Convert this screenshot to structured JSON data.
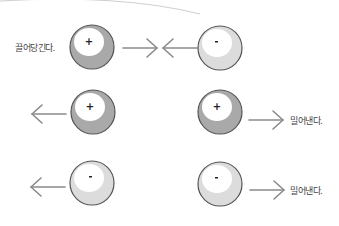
{
  "diagram": {
    "colors": {
      "positive_fill": "#a9a9a9",
      "negative_fill": "#dcdcdc",
      "highlight": "#ffffff",
      "outline": "#555555",
      "arrow": "#8a8a8a",
      "text": "#444444",
      "arc": "#cfcfcf"
    },
    "rows": [
      {
        "id": "row-attract",
        "label": "끌어당긴다.",
        "left_charge": {
          "sign": "+",
          "type": "positive"
        },
        "right_charge": {
          "sign": "-",
          "type": "negative"
        },
        "left_arrow": "right",
        "right_arrow": "left"
      },
      {
        "id": "row-repel-positive",
        "label": "밀어낸다.",
        "left_charge": {
          "sign": "+",
          "type": "positive"
        },
        "right_charge": {
          "sign": "+",
          "type": "positive"
        },
        "left_arrow": "left",
        "right_arrow": "right"
      },
      {
        "id": "row-repel-negative",
        "label": "밀어낸다.",
        "left_charge": {
          "sign": "-",
          "type": "negative"
        },
        "right_charge": {
          "sign": "-",
          "type": "negative"
        },
        "left_arrow": "left",
        "right_arrow": "right"
      }
    ]
  }
}
